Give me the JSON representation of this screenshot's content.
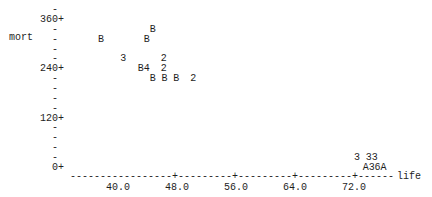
{
  "chart_data": {
    "type": "scatter",
    "title": "",
    "xlabel": "life",
    "ylabel": "mort",
    "xlim": [
      36.0,
      78.0
    ],
    "ylim": [
      0,
      384
    ],
    "x_ticks": [
      "40.0",
      "48.0",
      "56.0",
      "64.0",
      "72.0"
    ],
    "x_tick_values": [
      40,
      48,
      56,
      64,
      72
    ],
    "y_ticks": [
      "360+",
      "240+",
      "120+",
      "0+"
    ],
    "y_tick_values": [
      360,
      240,
      120,
      0
    ],
    "y_minor_step": 24,
    "grid": false,
    "legend": "none",
    "plot_style": "line-printer",
    "points": [
      {
        "x": 44.7,
        "y": 336,
        "symbol": "B"
      },
      {
        "x": 37.7,
        "y": 312,
        "symbol": "B"
      },
      {
        "x": 43.9,
        "y": 312,
        "symbol": "B"
      },
      {
        "x": 40.7,
        "y": 264,
        "symbol": "3"
      },
      {
        "x": 46.2,
        "y": 264,
        "symbol": "2"
      },
      {
        "x": 43.1,
        "y": 240,
        "symbol": "B"
      },
      {
        "x": 43.9,
        "y": 240,
        "symbol": "4"
      },
      {
        "x": 46.2,
        "y": 240,
        "symbol": "2"
      },
      {
        "x": 44.7,
        "y": 216,
        "symbol": "B"
      },
      {
        "x": 46.3,
        "y": 216,
        "symbol": "B"
      },
      {
        "x": 47.9,
        "y": 216,
        "symbol": "B"
      },
      {
        "x": 50.2,
        "y": 216,
        "symbol": "2"
      },
      {
        "x": 72.4,
        "y": 24,
        "symbol": "3"
      },
      {
        "x": 74.0,
        "y": 24,
        "symbol": "3"
      },
      {
        "x": 74.8,
        "y": 24,
        "symbol": "3"
      },
      {
        "x": 73.6,
        "y": 0,
        "symbol": "A"
      },
      {
        "x": 74.4,
        "y": 0,
        "symbol": "3"
      },
      {
        "x": 75.2,
        "y": 0,
        "symbol": "6"
      },
      {
        "x": 76.0,
        "y": 0,
        "symbol": "A"
      }
    ]
  }
}
